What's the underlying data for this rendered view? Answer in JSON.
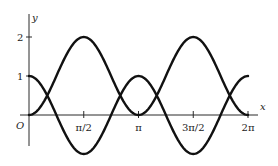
{
  "chart_data": {
    "type": "line",
    "title": "",
    "xlabel": "x",
    "ylabel": "y",
    "origin_label": "O",
    "xlim": [
      0,
      6.2832
    ],
    "ylim": [
      -1,
      2
    ],
    "grid": false,
    "legend": null,
    "x_ticks": [
      {
        "value": 1.5708,
        "label": "π/2"
      },
      {
        "value": 3.1416,
        "label": "π"
      },
      {
        "value": 4.7124,
        "label": "3π/2"
      },
      {
        "value": 6.2832,
        "label": "2π"
      }
    ],
    "y_ticks": [
      {
        "value": 1,
        "label": "1"
      },
      {
        "value": 2,
        "label": "2"
      }
    ],
    "x": [
      0,
      0.7854,
      1.5708,
      2.3562,
      3.1416,
      3.927,
      4.7124,
      5.4978,
      6.2832
    ],
    "series": [
      {
        "name": "y = cos 2x",
        "values": [
          1,
          0,
          -1,
          0,
          1,
          0,
          -1,
          0,
          1
        ]
      },
      {
        "name": "y = 1 - cos 2x",
        "values": [
          0,
          1,
          2,
          1,
          0,
          1,
          2,
          1,
          0
        ]
      }
    ],
    "intersections": [
      {
        "x": 0.5236,
        "y": 0.5
      },
      {
        "x": 2.618,
        "y": 0.5
      },
      {
        "x": 3.6652,
        "y": 0.5
      },
      {
        "x": 5.7596,
        "y": 0.5
      }
    ]
  }
}
